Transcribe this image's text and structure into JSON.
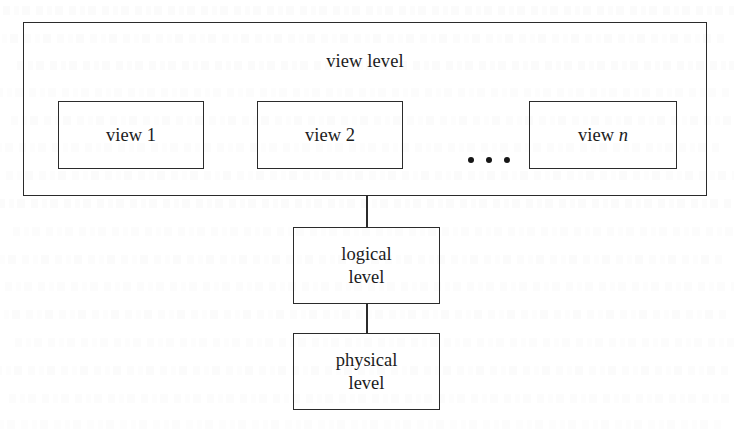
{
  "figure": {
    "kind": "block-diagram",
    "background_color": "#ffffff",
    "line_color": "#2b2b2b",
    "text_color": "#1c1c1c"
  },
  "view_level": {
    "title": "view level",
    "views": [
      {
        "label": "view 1",
        "name": "view",
        "index": "1",
        "italic_index": false
      },
      {
        "label": "view 2",
        "name": "view",
        "index": "2",
        "italic_index": false
      },
      {
        "label": "view n",
        "name": "view",
        "index": "n",
        "italic_index": true
      }
    ],
    "ellipsis": "• • •",
    "ellipsis_dot_count": 3
  },
  "levels": [
    {
      "id": "logical",
      "line1": "logical",
      "line2": "level",
      "full_label": "logical level"
    },
    {
      "id": "physical",
      "line1": "physical",
      "line2": "level",
      "full_label": "physical level"
    }
  ],
  "connections": [
    {
      "from": "view level",
      "to": "logical level"
    },
    {
      "from": "logical level",
      "to": "physical level"
    }
  ]
}
